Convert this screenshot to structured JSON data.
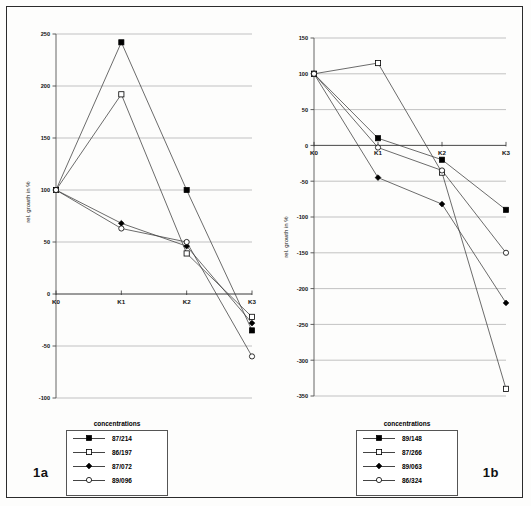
{
  "figure": {
    "label_left": "1a",
    "label_right": "1b"
  },
  "panels": {
    "left": {
      "name": "1a",
      "legend_title": "concentrations",
      "ylabel": "rel. growth in %",
      "xticks": [
        "K0",
        "K1",
        "K2",
        "K3"
      ],
      "yticks": [
        "250",
        "200",
        "150",
        "100",
        "50",
        "0",
        "-50",
        "-100"
      ]
    },
    "right": {
      "name": "1b",
      "legend_title": "concentrations",
      "ylabel": "rel. growth in %",
      "xticks": [
        "K0",
        "K1",
        "K2",
        "K3"
      ],
      "yticks": [
        "150",
        "100",
        "50",
        "0",
        "-50",
        "-100",
        "-150",
        "-200",
        "-250",
        "-300",
        "-350"
      ]
    }
  },
  "chart_data": [
    {
      "type": "line",
      "panel": "1a",
      "title": "",
      "xlabel": "",
      "ylabel": "rel. growth in %",
      "categories": [
        "K0",
        "K1",
        "K2",
        "K3"
      ],
      "ylim": [
        -100,
        250
      ],
      "ytick_step": 50,
      "grid": true,
      "legend_title": "concentrations",
      "legend_position": "below",
      "series": [
        {
          "name": "87/214",
          "marker": "filled-square",
          "values": [
            100,
            242,
            100,
            -35
          ]
        },
        {
          "name": "86/197",
          "marker": "open-square",
          "values": [
            100,
            192,
            39,
            -22
          ]
        },
        {
          "name": "87/072",
          "marker": "filled-diamond",
          "values": [
            100,
            68,
            46,
            -28
          ]
        },
        {
          "name": "89/096",
          "marker": "open-circle",
          "values": [
            100,
            63,
            50,
            -60
          ]
        }
      ]
    },
    {
      "type": "line",
      "panel": "1b",
      "title": "",
      "xlabel": "",
      "ylabel": "rel. growth in %",
      "categories": [
        "K0",
        "K1",
        "K2",
        "K3"
      ],
      "ylim": [
        -350,
        150
      ],
      "ytick_step": 50,
      "grid": true,
      "legend_title": "concentrations",
      "legend_position": "below",
      "series": [
        {
          "name": "89/148",
          "marker": "filled-square",
          "values": [
            100,
            10,
            -20,
            -90
          ]
        },
        {
          "name": "87/266",
          "marker": "open-square",
          "values": [
            100,
            115,
            -38,
            -340
          ]
        },
        {
          "name": "89/063",
          "marker": "filled-diamond",
          "values": [
            100,
            -45,
            -82,
            -220
          ]
        },
        {
          "name": "86/324",
          "marker": "open-circle",
          "values": [
            100,
            -3,
            -35,
            -150
          ]
        }
      ]
    }
  ]
}
